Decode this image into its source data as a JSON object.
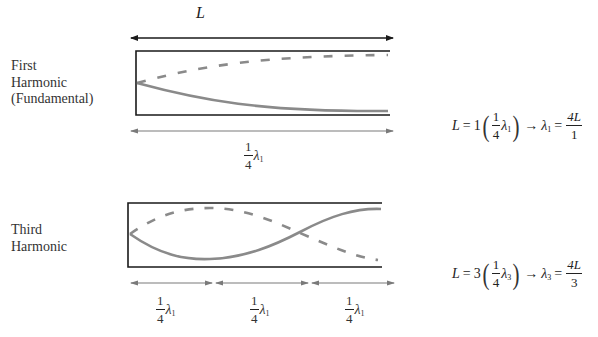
{
  "length_label": "L",
  "harmonics": [
    {
      "name_lines": [
        "First",
        "Harmonic",
        "(Fundamental)"
      ],
      "span_labels": [
        {
          "coef_num": "1",
          "coef_den": "4",
          "symbol": "λ",
          "sub": "1"
        }
      ],
      "equation": {
        "lhs": "L",
        "eq": "=",
        "multiplier": "1",
        "frac_num": "1",
        "frac_den": "4",
        "symbol": "λ",
        "sub": "1",
        "arrow": "→",
        "result_symbol": "λ",
        "result_sub": "1",
        "result_eq": "=",
        "result_num": "4L",
        "result_den": "1"
      }
    },
    {
      "name_lines": [
        "Third",
        "Harmonic"
      ],
      "span_labels": [
        {
          "coef_num": "1",
          "coef_den": "4",
          "symbol": "λ",
          "sub": "1"
        },
        {
          "coef_num": "1",
          "coef_den": "4",
          "symbol": "λ",
          "sub": "1"
        },
        {
          "coef_num": "1",
          "coef_den": "4",
          "symbol": "λ",
          "sub": "1"
        }
      ],
      "equation": {
        "lhs": "L",
        "eq": "=",
        "multiplier": "3",
        "frac_num": "1",
        "frac_den": "4",
        "symbol": "λ",
        "sub": "3",
        "arrow": "→",
        "result_symbol": "λ",
        "result_sub": "3",
        "result_eq": "=",
        "result_num": "4L",
        "result_den": "3"
      }
    }
  ],
  "colors": {
    "tube_outline": "#1a1a1a",
    "wave": "#8a8a8a",
    "dimension_arrow": "#7a7a7a",
    "length_arrow": "#1a1a1a"
  }
}
